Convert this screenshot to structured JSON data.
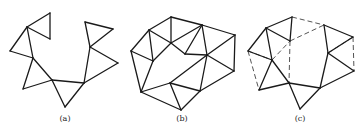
{
  "figure": {
    "panels": [
      {
        "label": "(a)",
        "label_pos": [
          65,
          121
        ],
        "solid_edges": [
          [
            [
              27,
              27
            ],
            [
              50,
              13
            ]
          ],
          [
            [
              50,
              13
            ],
            [
              50,
              39
            ]
          ],
          [
            [
              50,
              39
            ],
            [
              27,
              27
            ]
          ],
          [
            [
              27,
              27
            ],
            [
              10,
              51
            ]
          ],
          [
            [
              10,
              51
            ],
            [
              33,
              58
            ]
          ],
          [
            [
              27,
              27
            ],
            [
              33,
              58
            ]
          ],
          [
            [
              33,
              58
            ],
            [
              23,
              89
            ]
          ],
          [
            [
              23,
              89
            ],
            [
              52,
              80
            ]
          ],
          [
            [
              33,
              58
            ],
            [
              52,
              80
            ]
          ],
          [
            [
              52,
              80
            ],
            [
              65,
              107
            ]
          ],
          [
            [
              65,
              107
            ],
            [
              84,
              83
            ]
          ],
          [
            [
              52,
              80
            ],
            [
              84,
              83
            ]
          ],
          [
            [
              84,
              83
            ],
            [
              90,
              47
            ]
          ],
          [
            [
              90,
              47
            ],
            [
              85,
              22
            ]
          ],
          [
            [
              85,
              22
            ],
            [
              113,
              29
            ]
          ],
          [
            [
              113,
              29
            ],
            [
              90,
              47
            ]
          ],
          [
            [
              90,
              47
            ],
            [
              118,
              63
            ]
          ],
          [
            [
              118,
              63
            ],
            [
              84,
              83
            ]
          ]
        ],
        "dashed_edges": []
      },
      {
        "label": "(b)",
        "label_pos": [
          182,
          121
        ],
        "solid_edges": [
          [
            [
              171,
              17
            ],
            [
              149,
              30
            ]
          ],
          [
            [
              171,
              17
            ],
            [
              202,
              25
            ]
          ],
          [
            [
              171,
              17
            ],
            [
              171,
              43
            ]
          ],
          [
            [
              149,
              30
            ],
            [
              171,
              43
            ]
          ],
          [
            [
              149,
              30
            ],
            [
              131,
              51
            ]
          ],
          [
            [
              149,
              30
            ],
            [
              153,
              61
            ]
          ],
          [
            [
              171,
              43
            ],
            [
              202,
              25
            ]
          ],
          [
            [
              202,
              25
            ],
            [
              235,
              35
            ]
          ],
          [
            [
              202,
              25
            ],
            [
              185,
              54
            ]
          ],
          [
            [
              202,
              25
            ],
            [
              207,
              55
            ]
          ],
          [
            [
              171,
              43
            ],
            [
              185,
              54
            ]
          ],
          [
            [
              185,
              54
            ],
            [
              207,
              55
            ]
          ],
          [
            [
              235,
              35
            ],
            [
              207,
              55
            ]
          ],
          [
            [
              235,
              35
            ],
            [
              234,
              71
            ]
          ],
          [
            [
              207,
              55
            ],
            [
              234,
              71
            ]
          ],
          [
            [
              207,
              55
            ],
            [
              170,
              83
            ]
          ],
          [
            [
              207,
              55
            ],
            [
              200,
              91
            ]
          ],
          [
            [
              131,
              51
            ],
            [
              153,
              61
            ]
          ],
          [
            [
              131,
              51
            ],
            [
              141,
              92
            ]
          ],
          [
            [
              153,
              61
            ],
            [
              171,
              43
            ]
          ],
          [
            [
              153,
              61
            ],
            [
              141,
              92
            ]
          ],
          [
            [
              141,
              92
            ],
            [
              170,
              83
            ]
          ],
          [
            [
              141,
              92
            ],
            [
              181,
              110
            ]
          ],
          [
            [
              170,
              83
            ],
            [
              181,
              110
            ]
          ],
          [
            [
              170,
              83
            ],
            [
              200,
              91
            ]
          ],
          [
            [
              200,
              91
            ],
            [
              234,
              71
            ]
          ],
          [
            [
              200,
              91
            ],
            [
              181,
              110
            ]
          ]
        ],
        "dashed_edges": []
      },
      {
        "label": "(c)",
        "label_pos": [
          300,
          121
        ],
        "solid_edges": [
          [
            [
              266,
              28
            ],
            [
              292,
              17
            ]
          ],
          [
            [
              292,
              17
            ],
            [
              290,
              41
            ]
          ],
          [
            [
              290,
              41
            ],
            [
              266,
              28
            ]
          ],
          [
            [
              266,
              28
            ],
            [
              248,
              51
            ]
          ],
          [
            [
              248,
              51
            ],
            [
              272,
              60
            ]
          ],
          [
            [
              266,
              28
            ],
            [
              272,
              60
            ]
          ],
          [
            [
              272,
              60
            ],
            [
              259,
              90
            ]
          ],
          [
            [
              259,
              90
            ],
            [
              289,
              83
            ]
          ],
          [
            [
              272,
              60
            ],
            [
              289,
              83
            ]
          ],
          [
            [
              289,
              83
            ],
            [
              300,
              109
            ]
          ],
          [
            [
              300,
              109
            ],
            [
              320,
              88
            ]
          ],
          [
            [
              289,
              83
            ],
            [
              320,
              88
            ]
          ],
          [
            [
              320,
              88
            ],
            [
              328,
              53
            ]
          ],
          [
            [
              328,
              53
            ],
            [
              324,
              25
            ]
          ],
          [
            [
              324,
              25
            ],
            [
              353,
              37
            ]
          ],
          [
            [
              353,
              37
            ],
            [
              328,
              53
            ]
          ],
          [
            [
              328,
              53
            ],
            [
              354,
              71
            ]
          ],
          [
            [
              354,
              71
            ],
            [
              320,
              88
            ]
          ]
        ],
        "dashed_edges": [
          [
            [
              292,
              17
            ],
            [
              324,
              25
            ]
          ],
          [
            [
              290,
              41
            ],
            [
              324,
              25
            ]
          ],
          [
            [
              272,
              60
            ],
            [
              290,
              41
            ]
          ],
          [
            [
              290,
              41
            ],
            [
              289,
              83
            ]
          ],
          [
            [
              248,
              51
            ],
            [
              259,
              90
            ]
          ],
          [
            [
              248,
              51
            ],
            [
              272,
              60
            ]
          ],
          [
            [
              353,
              37
            ],
            [
              354,
              71
            ]
          ],
          [
            [
              328,
              53
            ],
            [
              353,
              37
            ]
          ]
        ]
      }
    ]
  }
}
